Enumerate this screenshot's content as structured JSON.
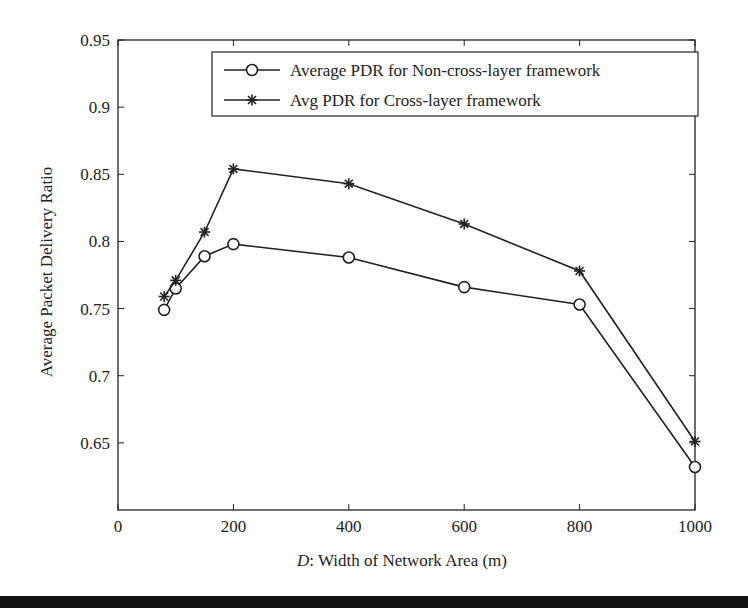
{
  "chart_data": {
    "type": "line",
    "title": "",
    "xlabel_italic": "D",
    "xlabel_rest": ": Width of Network Area (m)",
    "ylabel": "Average Packet Delivery Ratio",
    "xlim": [
      0,
      1000
    ],
    "ylim": [
      0.6,
      0.95
    ],
    "xticks": [
      0,
      200,
      400,
      600,
      800,
      1000
    ],
    "xtick_labels": [
      "0",
      "200",
      "400",
      "600",
      "800",
      "1000"
    ],
    "yticks": [
      0.65,
      0.7,
      0.75,
      0.8,
      0.85,
      0.9,
      0.95
    ],
    "ytick_labels": [
      "0.65",
      "0.7",
      "0.75",
      "0.8",
      "0.85",
      "0.9",
      "0.95"
    ],
    "grid": false,
    "legend_position": "top-right",
    "x": [
      80,
      100,
      150,
      200,
      400,
      600,
      800,
      1000
    ],
    "series": [
      {
        "name": "Average PDR for Non-cross-layer framework",
        "marker": "circle",
        "values": [
          0.749,
          0.765,
          0.789,
          0.798,
          0.788,
          0.766,
          0.753,
          0.632
        ]
      },
      {
        "name": "Avg PDR for Cross-layer framework",
        "marker": "asterisk",
        "values": [
          0.759,
          0.771,
          0.807,
          0.854,
          0.843,
          0.813,
          0.778,
          0.651
        ]
      }
    ],
    "color": "#222222"
  }
}
